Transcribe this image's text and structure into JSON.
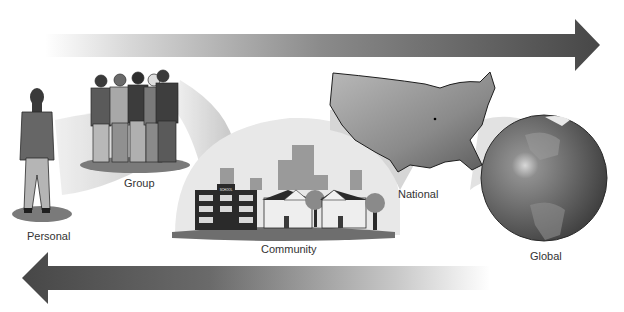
{
  "diagram": {
    "type": "scale-continuum",
    "levels": [
      {
        "id": "personal",
        "label": "Personal",
        "icon": "person-icon"
      },
      {
        "id": "group",
        "label": "Group",
        "icon": "group-of-people-icon"
      },
      {
        "id": "community",
        "label": "Community",
        "icon": "town-buildings-icon"
      },
      {
        "id": "national",
        "label": "National",
        "icon": "usa-map-icon"
      },
      {
        "id": "global",
        "label": "Global",
        "icon": "globe-icon"
      }
    ],
    "arrows": [
      {
        "direction": "right",
        "position": "top",
        "gradient": "light-to-dark"
      },
      {
        "direction": "left",
        "position": "bottom",
        "gradient": "dark-to-light"
      }
    ],
    "school_sign": "SCHOOL"
  },
  "colors": {
    "arrow_dark": "#4a4a4a",
    "arrow_light": "#ffffff",
    "wedge": "#d6d6d6",
    "label_text": "#333333"
  }
}
